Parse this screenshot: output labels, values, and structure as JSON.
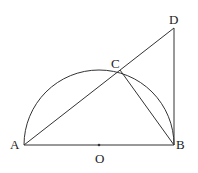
{
  "diagram": {
    "type": "geometry",
    "stroke_color": "#333333",
    "points": {
      "A": {
        "label": "A",
        "x": 24,
        "y": 145
      },
      "B": {
        "label": "B",
        "x": 174,
        "y": 145
      },
      "O": {
        "label": "O",
        "x": 99,
        "y": 145
      },
      "C": {
        "label": "C",
        "x": 120,
        "y": 70
      },
      "D": {
        "label": "D",
        "x": 174,
        "y": 28
      }
    },
    "segments": [
      "AB",
      "AD",
      "BD",
      "CB"
    ],
    "arcs": [
      {
        "center": "O",
        "from": "A",
        "to": "B",
        "radius": 75
      }
    ]
  }
}
